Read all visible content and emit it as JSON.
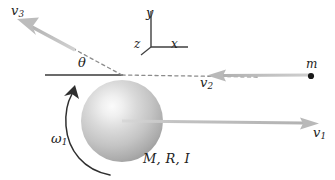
{
  "figure": {
    "caption_labels": {
      "v3": "v",
      "v3_sub": "3",
      "v2": "v",
      "v2_sub": "2",
      "v1": "v",
      "v1_sub": "1",
      "omega1": "ω",
      "omega1_sub": "1",
      "theta": "θ",
      "point_mass": "m",
      "body_props": "M, R, I",
      "axis_x": "x",
      "axis_y": "y",
      "axis_z": "z"
    },
    "colors": {
      "arrow_gray": "#b9b9b9",
      "arrow_gray_dark": "#a6a6a6",
      "line_black": "#3a3a3a",
      "dashed_gray": "#8c8c8c",
      "text": "#222222",
      "sphere_highlight": "#f2f2f2",
      "sphere_mid": "#c9c9c9",
      "sphere_edge": "#8f8f8f",
      "background": "#ffffff"
    },
    "geometry": {
      "sphere_center_x": 122,
      "sphere_center_y": 121,
      "sphere_radius": 41,
      "collision_vertex_x": 122,
      "collision_vertex_y": 75,
      "theta_degrees": 28,
      "v1_direction_degrees": 0,
      "v2_direction_degrees": 180,
      "v3_direction_degrees": 152
    },
    "axes": {
      "origin_x": 151,
      "origin_y": 47,
      "y_tip_y": 11,
      "x_tip_x": 188,
      "z_tip_x": 140,
      "z_tip_y": 54
    }
  }
}
